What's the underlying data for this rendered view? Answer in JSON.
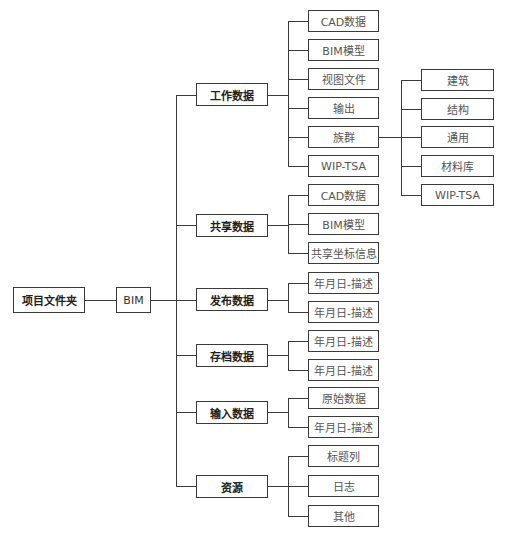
{
  "root": "项目文件夹",
  "level1": "BIM",
  "groups": [
    {
      "label": "工作数据",
      "children": [
        "CAD数据",
        "BIM模型",
        "视图文件",
        "输出",
        "族群",
        "WIP-TSA"
      ]
    },
    {
      "label": "共享数据",
      "children": [
        "CAD数据",
        "BIM模型",
        "共享坐标信息"
      ]
    },
    {
      "label": "发布数据",
      "children": [
        "年月日-描述",
        "年月日-描述"
      ]
    },
    {
      "label": "存档数据",
      "children": [
        "年月日-描述",
        "年月日-描述"
      ]
    },
    {
      "label": "输入数据",
      "children": [
        "原始数据",
        "年月日-描述"
      ]
    },
    {
      "label": "资源",
      "children": [
        "标题列",
        "日志",
        "其他"
      ]
    }
  ],
  "family_children": [
    "建筑",
    "结构",
    "通用",
    "材料库",
    "WIP-TSA"
  ]
}
